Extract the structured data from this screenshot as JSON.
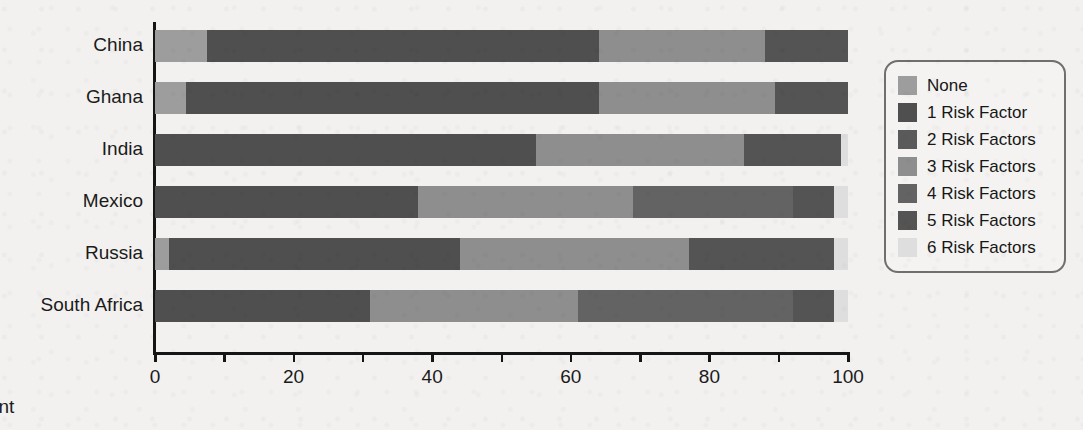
{
  "chart_data": {
    "type": "bar",
    "orientation": "horizontal",
    "stacked": true,
    "title": "",
    "xlabel": "Percent",
    "ylabel": "",
    "xlim": [
      0,
      100
    ],
    "xticks": [
      0,
      10,
      20,
      30,
      40,
      50,
      60,
      70,
      80,
      90,
      100
    ],
    "xtick_labels": [
      "0",
      "",
      "20",
      "",
      "40",
      "",
      "60",
      "",
      "80",
      "",
      "100"
    ],
    "grid": false,
    "legend_position": "right",
    "categories": [
      "China",
      "Ghana",
      "India",
      "Mexico",
      "Russia",
      "South Africa"
    ],
    "series": [
      {
        "name": "None",
        "color": "#9d9d9d",
        "values": [
          7.5,
          4.5,
          0.0,
          0.0,
          2.0,
          0.0
        ]
      },
      {
        "name": "1 Risk Factor",
        "color": "#4f4f4f",
        "values": [
          56.5,
          59.5,
          55.0,
          38.0,
          42.0,
          31.0
        ]
      },
      {
        "name": "2 Risk Factors",
        "color": "#5a5a5a",
        "values": [
          0.0,
          0.0,
          0.0,
          0.0,
          0.0,
          0.0
        ]
      },
      {
        "name": "3 Risk Factors",
        "color": "#8e8e8e",
        "values": [
          24.0,
          25.5,
          30.0,
          31.0,
          33.0,
          30.0
        ]
      },
      {
        "name": "4 Risk Factors",
        "color": "#636363",
        "values": [
          0.0,
          0.0,
          0.0,
          23.0,
          0.0,
          31.0
        ]
      },
      {
        "name": "5 Risk Factors",
        "color": "#545454",
        "values": [
          12.0,
          10.5,
          14.0,
          6.0,
          21.0,
          6.0
        ]
      },
      {
        "name": "6 Risk Factors",
        "color": "#dedede",
        "values": [
          0.0,
          0.0,
          1.0,
          2.0,
          2.0,
          2.0
        ]
      }
    ],
    "stacks": [
      {
        "category": "China",
        "segments": [
          {
            "series": "None",
            "start": 0.0,
            "end": 7.5,
            "value": 7.5
          },
          {
            "series": "1 Risk Factor",
            "start": 7.5,
            "end": 64.0,
            "value": 56.5
          },
          {
            "series": "3 Risk Factors",
            "start": 64.0,
            "end": 88.0,
            "value": 24.0
          },
          {
            "series": "5 Risk Factors",
            "start": 88.0,
            "end": 100.0,
            "value": 12.0
          }
        ]
      },
      {
        "category": "Ghana",
        "segments": [
          {
            "series": "None",
            "start": 0.0,
            "end": 4.5,
            "value": 4.5
          },
          {
            "series": "1 Risk Factor",
            "start": 4.5,
            "end": 64.0,
            "value": 59.5
          },
          {
            "series": "3 Risk Factors",
            "start": 64.0,
            "end": 89.5,
            "value": 25.5
          },
          {
            "series": "5 Risk Factors",
            "start": 89.5,
            "end": 100.0,
            "value": 10.5
          }
        ]
      },
      {
        "category": "India",
        "segments": [
          {
            "series": "1 Risk Factor",
            "start": 0.0,
            "end": 55.0,
            "value": 55.0
          },
          {
            "series": "3 Risk Factors",
            "start": 55.0,
            "end": 85.0,
            "value": 30.0
          },
          {
            "series": "5 Risk Factors",
            "start": 85.0,
            "end": 99.0,
            "value": 14.0
          },
          {
            "series": "6 Risk Factors",
            "start": 99.0,
            "end": 100.0,
            "value": 1.0
          }
        ]
      },
      {
        "category": "Mexico",
        "segments": [
          {
            "series": "1 Risk Factor",
            "start": 0.0,
            "end": 38.0,
            "value": 38.0
          },
          {
            "series": "3 Risk Factors",
            "start": 38.0,
            "end": 69.0,
            "value": 31.0
          },
          {
            "series": "4 Risk Factors",
            "start": 69.0,
            "end": 92.0,
            "value": 23.0
          },
          {
            "series": "5 Risk Factors",
            "start": 92.0,
            "end": 98.0,
            "value": 6.0
          },
          {
            "series": "6 Risk Factors",
            "start": 98.0,
            "end": 100.0,
            "value": 2.0
          }
        ]
      },
      {
        "category": "Russia",
        "segments": [
          {
            "series": "None",
            "start": 0.0,
            "end": 2.0,
            "value": 2.0
          },
          {
            "series": "1 Risk Factor",
            "start": 2.0,
            "end": 44.0,
            "value": 42.0
          },
          {
            "series": "3 Risk Factors",
            "start": 44.0,
            "end": 77.0,
            "value": 33.0
          },
          {
            "series": "5 Risk Factors",
            "start": 77.0,
            "end": 98.0,
            "value": 21.0
          },
          {
            "series": "6 Risk Factors",
            "start": 98.0,
            "end": 100.0,
            "value": 2.0
          }
        ]
      },
      {
        "category": "South Africa",
        "segments": [
          {
            "series": "1 Risk Factor",
            "start": 0.0,
            "end": 31.0,
            "value": 31.0
          },
          {
            "series": "3 Risk Factors",
            "start": 31.0,
            "end": 61.0,
            "value": 30.0
          },
          {
            "series": "4 Risk Factors",
            "start": 61.0,
            "end": 92.0,
            "value": 31.0
          },
          {
            "series": "5 Risk Factors",
            "start": 92.0,
            "end": 98.0,
            "value": 6.0
          },
          {
            "series": "6 Risk Factors",
            "start": 98.0,
            "end": 100.0,
            "value": 2.0
          }
        ]
      }
    ],
    "legend": [
      {
        "label": "None",
        "color": "#9d9d9d"
      },
      {
        "label": "1 Risk Factor",
        "color": "#4f4f4f"
      },
      {
        "label": "2 Risk Factors",
        "color": "#5a5a5a"
      },
      {
        "label": "3 Risk Factors",
        "color": "#8e8e8e"
      },
      {
        "label": "4 Risk Factors",
        "color": "#636363"
      },
      {
        "label": "5 Risk Factors",
        "color": "#545454"
      },
      {
        "label": "6 Risk Factors",
        "color": "#dedede"
      }
    ]
  },
  "colors": {
    "background": "#f2f1ef",
    "axis": "#151515",
    "text": "#1b1b1b",
    "legend_border": "#6f6f6f"
  }
}
